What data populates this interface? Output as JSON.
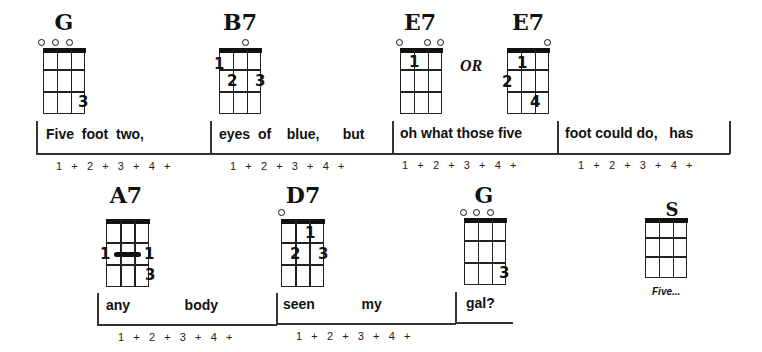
{
  "line1": {
    "chords": [
      {
        "name": "G",
        "open_strings": [
          1,
          2,
          3
        ],
        "fingers": [
          {
            "num": "3",
            "string": 4,
            "fret": 3
          }
        ]
      },
      {
        "name": "B7",
        "open_strings": [
          3
        ],
        "fingers": [
          {
            "num": "1",
            "string": 1,
            "fret": 1
          },
          {
            "num": "2",
            "string": 2,
            "fret": 2
          },
          {
            "num": "3",
            "string": 4,
            "fret": 2
          }
        ]
      },
      {
        "name": "E7",
        "open_strings": [
          1,
          3,
          4
        ],
        "fingers": [
          {
            "num": "1",
            "string": 2,
            "fret": 1
          }
        ]
      },
      {
        "name": "E7",
        "open_strings": [
          4
        ],
        "fingers": [
          {
            "num": "1",
            "string": 2,
            "fret": 1
          },
          {
            "num": "2",
            "string": 1,
            "fret": 2
          },
          {
            "num": "4",
            "string": 3,
            "fret": 3
          }
        ]
      }
    ],
    "or_label": "OR",
    "measures": [
      {
        "lyric": "Five  foot  two,",
        "beats": "1   +   2   +   3   +   4   +"
      },
      {
        "lyric": "eyes  of    blue,      but",
        "beats": "1   +   2   +   3   +   4   +"
      },
      {
        "lyric": "oh what those five",
        "beats": "1   +   2   +   3   +   4   +"
      },
      {
        "lyric": "foot could do,   has",
        "beats": "1   +   2   +   3   +   4   +"
      }
    ]
  },
  "line2": {
    "chords": [
      {
        "name": "A7",
        "open_strings": [],
        "barre": {
          "fret": 2,
          "label_left": "1",
          "label_right": "1"
        },
        "fingers": [
          {
            "num": "3",
            "string": 4,
            "fret": 3
          }
        ]
      },
      {
        "name": "D7",
        "open_strings": [
          1
        ],
        "fingers": [
          {
            "num": "1",
            "string": 3,
            "fret": 1
          },
          {
            "num": "2",
            "string": 2,
            "fret": 2
          },
          {
            "num": "3",
            "string": 4,
            "fret": 2
          }
        ]
      },
      {
        "name": "G",
        "open_strings": [
          1,
          2,
          3
        ],
        "fingers": [
          {
            "num": "3",
            "string": 4,
            "fret": 3
          }
        ]
      },
      {
        "name": "S",
        "open_strings": [],
        "fingers": []
      }
    ],
    "measures": [
      {
        "lyric": "any              body",
        "beats": "1   +   2   +   3   +   4   +"
      },
      {
        "lyric": "seen            my",
        "beats": "1   +   2   +   3   +   4   +"
      },
      {
        "lyric": "gal?",
        "beats": ""
      }
    ],
    "caption": "Five..."
  }
}
